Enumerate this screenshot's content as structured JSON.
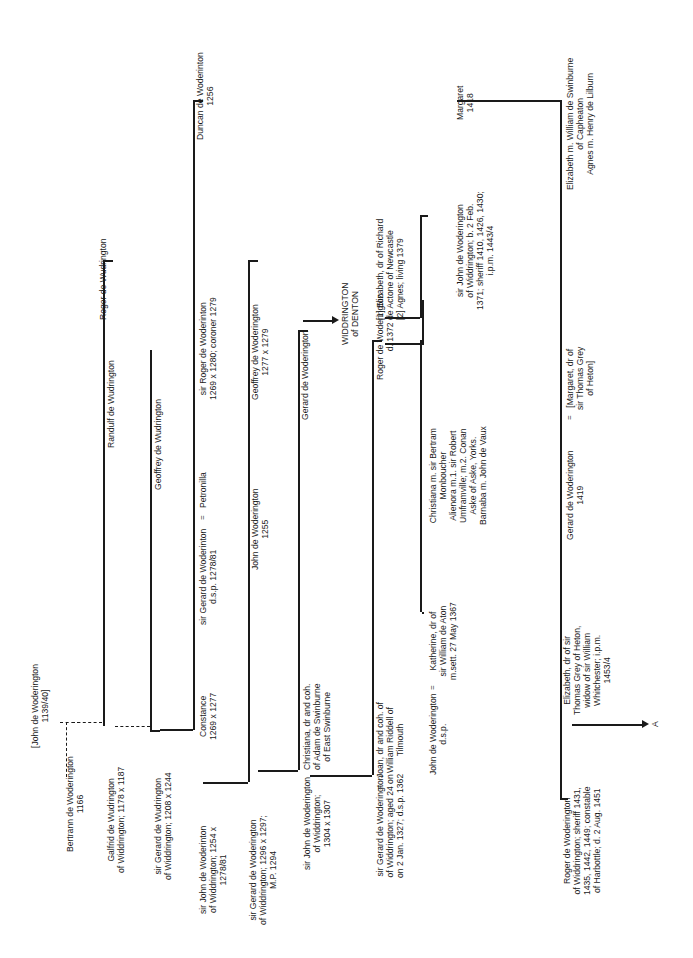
{
  "chart": {
    "orientation": "rotated-90-ccw",
    "persons": {
      "john_1139": "[John de Woderington\n1139/40]",
      "bertrann": "Bertrann de Woderington\n1166",
      "galfrid": "Galfrid de Wudrington\nof Widdrington; 1178 x 1187",
      "randulf": "Randulf de Wudrington",
      "roger_wud": "Roger de Wudrington",
      "gerard_1208": "sir Gerard de Wudrington\nof Widdrington; 1208 x 1244",
      "geoffrey_wud": "Geoffrey de Wudrington",
      "john_1254": "sir John de Woderinton\nof Widdrington; 1254 x\n1278/81",
      "constance": "Constance\n1269 x 1277",
      "gerard_dsp": "sir Gerard de Woderinton\nd.s.p. 1278/81",
      "petronilla": "Petronilla",
      "roger_coroner": "sir Roger de Woderinton\n1269 x 1280; coroner 1279",
      "duncan": "Duncan de Woderinton\n1256",
      "gerard_1296": "sir Gerard de Woderington\nof Widdrington; 1296 x 1297;\nM.P. 1294",
      "john_1255": "John de Woderington\n1255",
      "geoffrey_1277": "Geoffrey de Woderington\n1277 x 1279",
      "john_1304": "sir John de Woderington\nof Widdrington;\n1304 x 1307",
      "christiana_swinburne": "Christiana, dr and coh.\nof Adam de Swinburne\nof East Swinburne",
      "gerard_denton": "Gerard de Woderington",
      "denton_branch": "WIDDRINGTON\nof DENTON",
      "gerard_1327": "sir Gerard de Woderington\nof Widdrington; aged 24 on\non 2 Jan. 1327; d.s.p. 1362",
      "joan_riddell": "Joan, dr and coh. of\nWilliam Riddell of\nTilmouth",
      "roger_1372": "Roger de Woderington\nd. 1372",
      "elizabeth_actone": "[1] Elizabeth, dr of Richard\nde Actone of Newcastle\n[2] Agnes; living 1379",
      "john_dsp": "John de Woderington\nd.s.p.",
      "katherine_aton": "Katherine, dr of\nsir William de Aton\nm.sett. 27 May 1367",
      "christiana_daughters": "Christiana m. sir Bertram\nMonboucher\nAlienora m.1. sir Robert\nUmframville; m.2. Conan\nAske of Aske, Yorks.\nBarnaba m. John de Vaux",
      "john_1371": "sir John de Woderington\nof Widdrington; b. 2 Feb.\n1371; sheriff 1410, 1426, 1430;\ni.p.m. 1443/4",
      "margaret_1418": "Margaret\n1418",
      "roger_1431": "Roger de Woderington\nof Widdrington; sheriff 1431,\n1435, 1442, 1449; constable\nof Harbottle; d. 2 Aug. 1451",
      "elizabeth_grey": "Elizabeth, dr of sir\nThomas Grey of Heton,\nwidow of sir William\nWhitchester; i.p.m.\n1453/4",
      "gerard_1419": "Gerard de Woderington\n1419",
      "margaret_grey": "[Margaret, dr of\nsir Thomas Grey\nof Heton]",
      "elizabeth_agnes": "Elizabeth m. William de Swinburne\nof Capheaton\nAgnes m. Henry de Lilburn"
    },
    "marriage_symbol": "=",
    "continuation_label": "A"
  }
}
